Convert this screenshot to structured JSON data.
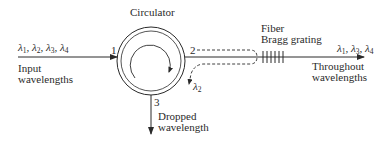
{
  "diagram": {
    "title": "Circulator",
    "colors": {
      "stroke": "#2a2a2a",
      "background": "#ffffff"
    },
    "ports": [
      {
        "id": "1",
        "label": "1"
      },
      {
        "id": "2",
        "label": "2"
      },
      {
        "id": "3",
        "label": "3"
      }
    ],
    "input": {
      "wavelengths": [
        "λ1",
        "λ2",
        "λ3",
        "λ4"
      ],
      "label_line1": "Input",
      "label_line2": "wavelengths"
    },
    "grating": {
      "label_line1": "Fiber",
      "label_line2": "Bragg grating",
      "tick_count": 6
    },
    "reflected": {
      "wavelength": "λ2"
    },
    "throughout": {
      "wavelengths": [
        "λ1",
        "λ3",
        "λ4"
      ],
      "label_line1": "Throughout",
      "label_line2": "wavelengths"
    },
    "dropped": {
      "label_line1": "Dropped",
      "label_line2": "wavelength"
    }
  }
}
